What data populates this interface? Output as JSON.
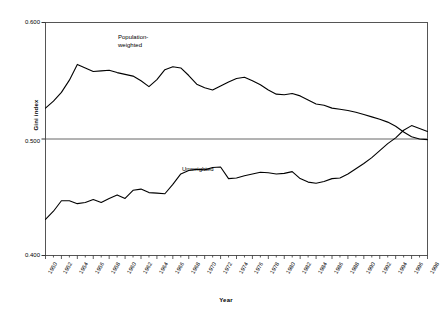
{
  "chart_data": {
    "type": "line",
    "title": "",
    "xlabel": "Year",
    "ylabel": "Gini index",
    "ylim": [
      0.4,
      0.6
    ],
    "ytick_labels": [
      "0.600",
      "0.500",
      "0.400"
    ],
    "ytick_values": [
      0.6,
      0.5,
      0.4
    ],
    "grid": true,
    "gridlines_y": [
      0.5
    ],
    "legend_position": "inline-annotations",
    "x": [
      1950,
      1951,
      1952,
      1953,
      1954,
      1955,
      1956,
      1957,
      1958,
      1959,
      1960,
      1961,
      1962,
      1963,
      1964,
      1965,
      1966,
      1967,
      1968,
      1969,
      1970,
      1971,
      1972,
      1973,
      1974,
      1975,
      1976,
      1977,
      1978,
      1979,
      1980,
      1981,
      1982,
      1983,
      1984,
      1985,
      1986,
      1987,
      1988,
      1989,
      1990,
      1991,
      1992,
      1993,
      1994,
      1995,
      1996,
      1997,
      1998
    ],
    "xtick_labels": [
      "1950",
      "1952",
      "1954",
      "1956",
      "1958",
      "1960",
      "1962",
      "1964",
      "1966",
      "1968",
      "1970",
      "1972",
      "1974",
      "1976",
      "1978",
      "1980",
      "1982",
      "1984",
      "1986",
      "1988",
      "1990",
      "1992",
      "1994",
      "1996",
      "1998"
    ],
    "series": [
      {
        "name": "Population-weighted",
        "label_lines": [
          "Population-",
          "weighted"
        ],
        "color": "#000000",
        "values": [
          0.5265,
          0.5325,
          0.54,
          0.5505,
          0.564,
          0.561,
          0.558,
          0.5585,
          0.559,
          0.557,
          0.5555,
          0.554,
          0.55,
          0.545,
          0.551,
          0.5595,
          0.562,
          0.561,
          0.5545,
          0.547,
          0.544,
          0.542,
          0.5455,
          0.549,
          0.552,
          0.553,
          0.55,
          0.5465,
          0.542,
          0.5385,
          0.538,
          0.539,
          0.537,
          0.5335,
          0.53,
          0.529,
          0.5265,
          0.5255,
          0.5245,
          0.523,
          0.521,
          0.519,
          0.517,
          0.5145,
          0.511,
          0.506,
          0.502,
          0.5,
          0.4995
        ]
      },
      {
        "name": "Unweighted",
        "label_lines": [
          "Unweighted"
        ],
        "color": "#000000",
        "values": [
          0.431,
          0.438,
          0.447,
          0.447,
          0.4445,
          0.4455,
          0.448,
          0.4455,
          0.449,
          0.452,
          0.449,
          0.456,
          0.457,
          0.454,
          0.4535,
          0.453,
          0.461,
          0.47,
          0.473,
          0.474,
          0.4735,
          0.4755,
          0.476,
          0.466,
          0.4665,
          0.4685,
          0.47,
          0.4715,
          0.471,
          0.47,
          0.4705,
          0.472,
          0.466,
          0.463,
          0.462,
          0.4635,
          0.466,
          0.4665,
          0.47,
          0.4745,
          0.479,
          0.484,
          0.49,
          0.496,
          0.501,
          0.5075,
          0.5115,
          0.509,
          0.5065
        ]
      }
    ],
    "annotations": [
      {
        "text": "Population-weighted",
        "target_series": "Population-weighted"
      },
      {
        "text": "Unweighted",
        "target_series": "Unweighted"
      }
    ]
  },
  "labels": {
    "ylabel": "Gini index",
    "xlabel": "Year",
    "y_top": "0.600",
    "y_mid": "0.500",
    "y_bot": "0.400",
    "series_pop_line1": "Population-",
    "series_pop_line2": "weighted",
    "series_unweighted": "Unweighted"
  }
}
